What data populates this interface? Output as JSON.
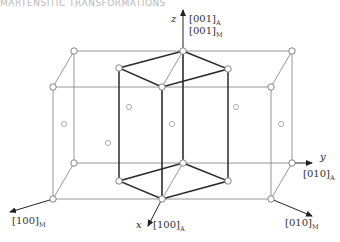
{
  "header": {
    "text": "MARTENSITIC TRANSFORMATIONS"
  },
  "diagram": {
    "colors": {
      "thin_line": "#8a8a8a",
      "thick_line": "#2a2a2a",
      "atom_stroke": "#777777",
      "atom_fill": "#ffffff"
    },
    "axes": {
      "z": {
        "letter": "z",
        "label1": "[001]",
        "sub1": "A",
        "label2": "[001]",
        "sub2": "M"
      },
      "y": {
        "letter": "y",
        "label": "[010]",
        "sub": "A"
      },
      "x": {
        "letter": "x",
        "label": "[100]",
        "sub": "A"
      },
      "m100": {
        "label": "[100]",
        "sub": "M"
      },
      "m010": {
        "label": "[010]",
        "sub": "M"
      }
    },
    "outer_box": {
      "corners": [
        [
          74,
          51
        ],
        [
          292,
          51
        ],
        [
          271,
          87
        ],
        [
          53,
          87
        ],
        [
          74,
          163
        ],
        [
          292,
          163
        ],
        [
          271,
          199
        ],
        [
          53,
          199
        ]
      ]
    },
    "inner_cell_top": [
      [
        183,
        51
      ],
      [
        228,
        69
      ],
      [
        162,
        87
      ],
      [
        119,
        68
      ]
    ],
    "inner_cell_bottom": [
      [
        183,
        163
      ],
      [
        228,
        181
      ],
      [
        162,
        199
      ],
      [
        119,
        181
      ]
    ],
    "face_atoms": [
      [
        64,
        124
      ],
      [
        129,
        107
      ],
      [
        108,
        143
      ],
      [
        172,
        124
      ],
      [
        236,
        107
      ],
      [
        281,
        124
      ]
    ]
  }
}
